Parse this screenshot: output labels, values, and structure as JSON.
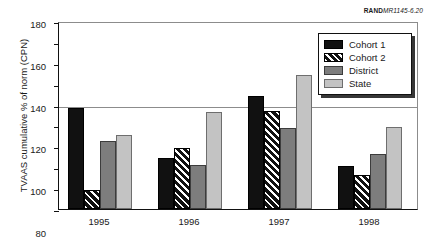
{
  "figure": {
    "source_label_brand": "RAND",
    "source_label_number": "MR1145-6.20"
  },
  "legend": {
    "position": "top-right",
    "entries": [
      {
        "label": "Cohort 1",
        "swatch": "solid-black-swatch"
      },
      {
        "label": "Cohort 2",
        "swatch": "diagonal-hatch-swatch"
      },
      {
        "label": "District",
        "swatch": "medium-gray-swatch"
      },
      {
        "label": "State",
        "swatch": "light-gray-swatch"
      }
    ]
  },
  "chart_data": {
    "type": "bar",
    "title": "",
    "xlabel": "",
    "ylabel": "TVAAS cumulative % of norm (CPN)",
    "categories": [
      "1995",
      "1996",
      "1997",
      "1998"
    ],
    "series": [
      {
        "name": "Cohort 1",
        "color": "#111111",
        "values": [
          97,
          49,
          108,
          41
        ]
      },
      {
        "name": "Cohort 2",
        "color": "#111111",
        "values": [
          18,
          58,
          94,
          33
        ]
      },
      {
        "name": "District",
        "color": "#7d7d7d",
        "values": [
          65,
          42,
          78,
          53
        ]
      },
      {
        "name": "State",
        "color": "#c3c3c3",
        "values": [
          71,
          93,
          128,
          79
        ]
      }
    ],
    "ylim": [
      0,
      180
    ],
    "ytick_step": 20,
    "yticks": [
      0,
      20,
      40,
      60,
      80,
      100,
      120,
      140,
      160,
      180
    ],
    "reference_line": 100,
    "grid": false,
    "legend_position": "upper right"
  }
}
